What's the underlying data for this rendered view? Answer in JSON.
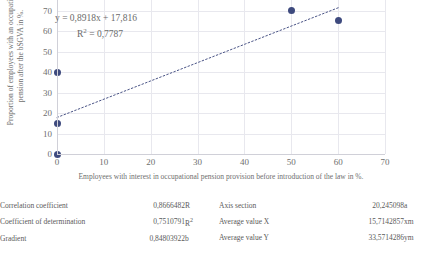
{
  "chart_data": {
    "type": "scatter",
    "title": "",
    "xlabel": "Employees with interest in occupational pension provision before introduction of the law in %.",
    "ylabel": "Proportion of employees with an occupational pension after the bSGVA in %.",
    "xlim": [
      0,
      70
    ],
    "ylim": [
      0,
      80
    ],
    "xticks": [
      0,
      10,
      20,
      30,
      40,
      50,
      60,
      70
    ],
    "yticks": [
      0,
      10,
      20,
      30,
      40,
      50,
      60,
      70
    ],
    "grid": true,
    "legend": "none",
    "marker_color": "#3e4a7e",
    "trendline_color": "#4a5486",
    "points": [
      {
        "x": 0,
        "y": 0
      },
      {
        "x": 0,
        "y": 15
      },
      {
        "x": 0,
        "y": 40
      },
      {
        "x": 50,
        "y": 70
      },
      {
        "x": 60,
        "y": 65
      }
    ],
    "trendline": {
      "style": "dotted",
      "slope": 0.8918,
      "intercept": 17.816,
      "x_start": 0,
      "x_end": 60
    },
    "annotations": {
      "equation": "y = 0,8918x + 17,816",
      "r_squared_label": "R",
      "r_squared_sup": "2",
      "r_squared_value": " = 0,7787"
    }
  },
  "stats_left": {
    "rows": [
      {
        "label": "Correlation coefficient",
        "value": "0,8666482",
        "symbol": "R",
        "symbol_sup": ""
      },
      {
        "label": "Coefficient of determination",
        "value": "0,7510791",
        "symbol": "R",
        "symbol_sup": "2"
      },
      {
        "label": "Gradient",
        "value": "0,84803922",
        "symbol": "b",
        "symbol_sup": ""
      }
    ]
  },
  "stats_right": {
    "rows": [
      {
        "label": "Axis section",
        "value": "20,245098",
        "symbol": "a",
        "symbol_sup": ""
      },
      {
        "label": "Average value X",
        "value": "15,7142857",
        "symbol": "xm",
        "symbol_sup": ""
      },
      {
        "label": "Average value Y",
        "value": "33,5714286",
        "symbol": "ym",
        "symbol_sup": ""
      }
    ]
  }
}
